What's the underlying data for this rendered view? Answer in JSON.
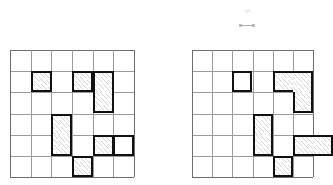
{
  "figure": {
    "title": "",
    "annotation": {
      "text": "5",
      "mark_name": "pencil-annotation-mark"
    },
    "grid_color": "#9b9b9b",
    "grid_edge_color": "#6d6d6d",
    "shape_outline_color": "#111111",
    "shade_color": "#787878",
    "paper_color": "#ffffff"
  },
  "grids": [
    {
      "name": "left-grid",
      "label": "",
      "rows": 6,
      "cols": 6,
      "x": 10,
      "y": 50,
      "width": 124,
      "height": 127,
      "shapes": [
        {
          "name": "single-a",
          "shaded": true,
          "cells": [
            [
              1,
              1
            ]
          ]
        },
        {
          "name": "single-b",
          "shaded": true,
          "cells": [
            [
              1,
              3
            ]
          ]
        },
        {
          "name": "vertical-domino",
          "shaded": true,
          "cells": [
            [
              1,
              4
            ],
            [
              2,
              4
            ]
          ]
        },
        {
          "name": "vertical-domino-2",
          "shaded": true,
          "cells": [
            [
              3,
              2
            ],
            [
              4,
              2
            ]
          ]
        },
        {
          "name": "single-c",
          "shaded": true,
          "cells": [
            [
              4,
              4
            ]
          ]
        },
        {
          "name": "single-d",
          "shaded": false,
          "cells": [
            [
              4,
              5
            ]
          ]
        },
        {
          "name": "single-e",
          "shaded": true,
          "cells": [
            [
              5,
              3
            ]
          ]
        }
      ]
    },
    {
      "name": "right-grid",
      "label": "",
      "rows": 6,
      "cols": 6,
      "x": 192,
      "y": 50,
      "width": 121,
      "height": 127,
      "shapes": [
        {
          "name": "single-a",
          "shaded": false,
          "cells": [
            [
              1,
              2
            ]
          ]
        },
        {
          "name": "j-tromino",
          "shaded": true,
          "cells": [
            [
              1,
              4
            ],
            [
              1,
              5
            ],
            [
              2,
              5
            ]
          ]
        },
        {
          "name": "s-tromino",
          "shaded": true,
          "cells": [
            [
              3,
              3
            ],
            [
              4,
              3
            ],
            [
              5,
              4
            ]
          ]
        },
        {
          "name": "horizontal-domino",
          "shaded": true,
          "cells": [
            [
              4,
              5
            ],
            [
              4,
              6
            ]
          ]
        }
      ]
    }
  ]
}
